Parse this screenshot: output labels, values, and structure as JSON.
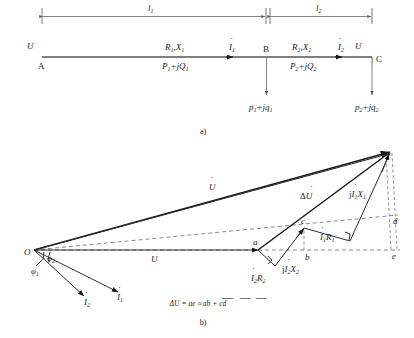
{
  "figure": {
    "panel_a": {
      "caption": "a)",
      "dimensions": [
        {
          "name": "length-1",
          "label": "l",
          "subscript": "1"
        },
        {
          "name": "length-2",
          "label": "l",
          "subscript": "2"
        }
      ],
      "nodes": [
        {
          "name": "node-a",
          "label": "A"
        },
        {
          "name": "node-b",
          "label": "B"
        },
        {
          "name": "node-c",
          "label": "C"
        }
      ],
      "source_voltage": {
        "label": "U",
        "dot": "˙"
      },
      "end_voltage": {
        "label": "U",
        "dot": "˙"
      },
      "segments": [
        {
          "name": "segment-1",
          "impedance": "R",
          "impedance_sub": "1",
          "impedance2": "X",
          "impedance2_sub": "1",
          "power": "P",
          "power_sub": "1",
          "power_imag": "+jQ",
          "power_imag_sub": "1",
          "current": "I",
          "current_sub": "1"
        },
        {
          "name": "segment-2",
          "impedance": "R",
          "impedance_sub": "2",
          "impedance2": "X",
          "impedance2_sub": "2",
          "power": "P",
          "power_sub": "2",
          "power_imag": "+jQ",
          "power_imag_sub": "2",
          "current": "I",
          "current_sub": "2"
        }
      ],
      "loads": [
        {
          "name": "load-1",
          "label": "p",
          "sub": "1",
          "rest": "+jq",
          "rest_sub": "1"
        },
        {
          "name": "load-2",
          "label": "p",
          "sub": "2",
          "rest": "+jq",
          "rest_sub": "2"
        }
      ]
    },
    "panel_b": {
      "caption": "b)",
      "origin_label": "O",
      "angles": [
        {
          "name": "angle-phi-1",
          "label": "φ",
          "sub": "1"
        },
        {
          "name": "angle-phi-2",
          "label": "φ",
          "sub": "2"
        }
      ],
      "currents": [
        {
          "name": "current-phasor-1",
          "label": "I",
          "sub": "1",
          "dot": "˙"
        },
        {
          "name": "current-phasor-2",
          "label": "I",
          "sub": "2",
          "dot": "˙"
        }
      ],
      "voltages": [
        {
          "name": "sending-voltage-phasor",
          "label": "U",
          "dot": "˙"
        },
        {
          "name": "receiving-voltage-phasor",
          "label": "U",
          "dot": "˙"
        },
        {
          "name": "voltage-drop-phasor",
          "prefix": "Δ",
          "label": "U",
          "dot": "˙"
        }
      ],
      "drops": [
        {
          "name": "drop-i2r2",
          "label": "I",
          "sub": "2",
          "rest": "R",
          "rest_sub": "2",
          "dot": "˙",
          "prefix": ""
        },
        {
          "name": "drop-ji2x2",
          "label": "I",
          "sub": "2",
          "rest": "X",
          "rest_sub": "2",
          "dot": "˙",
          "prefix": "j"
        },
        {
          "name": "drop-i1r1",
          "label": "I",
          "sub": "1",
          "rest": "R",
          "rest_sub": "1",
          "dot": "˙",
          "prefix": ""
        },
        {
          "name": "drop-ji1x1",
          "label": "I",
          "sub": "1",
          "rest": "X",
          "rest_sub": "1",
          "dot": "˙",
          "prefix": "j"
        }
      ],
      "points": [
        {
          "name": "point-a",
          "label": "a"
        },
        {
          "name": "point-b",
          "label": "b"
        },
        {
          "name": "point-c",
          "label": "c"
        },
        {
          "name": "point-d",
          "label": "d"
        },
        {
          "name": "point-e",
          "label": "e"
        }
      ],
      "equation": {
        "name": "voltage-drop-equation",
        "lhs": "ΔU",
        "eq": "=",
        "term1": "ae",
        "approx": "≈",
        "term2": "ab",
        "plus": "+",
        "term3": "cd"
      }
    }
  }
}
